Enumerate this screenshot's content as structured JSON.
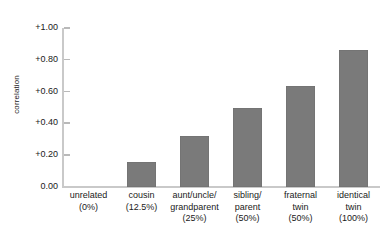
{
  "chart_data": {
    "type": "bar",
    "title": "",
    "subtitle": "",
    "xlabel": "",
    "ylabel": "correlation",
    "ylim": [
      0.0,
      1.0
    ],
    "grid": false,
    "legend": "none",
    "bar_color": "#7a7a7a",
    "axis_color": "#c9c9c9",
    "categories": [
      "unrelated (0%)",
      "cousin (12.5%)",
      "aunt/uncle/grandparent (25%)",
      "sibling/parent (50%)",
      "fraternal twin (50%)",
      "identical twin (100%)"
    ],
    "category_label_lines": [
      [
        "unrelated",
        "(0%)"
      ],
      [
        "cousin",
        "(12.5%)"
      ],
      [
        "aunt/uncle/",
        "grandparent",
        "(25%)"
      ],
      [
        "sibling/",
        "parent",
        "(50%)"
      ],
      [
        "fraternal",
        "twin",
        "(50%)"
      ],
      [
        "identical",
        "twin",
        "(100%)"
      ]
    ],
    "values": [
      0.0,
      0.155,
      0.32,
      0.5,
      0.635,
      0.86
    ],
    "ytick_values": [
      1.0,
      0.8,
      0.6,
      0.4,
      0.2,
      0.0
    ],
    "ytick_labels": [
      "+1.00",
      "+0.80",
      "+0.60",
      "+0.40",
      "+0.20",
      "0.00"
    ]
  }
}
